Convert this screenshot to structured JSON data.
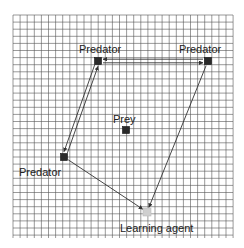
{
  "grid": {
    "x0": 13,
    "y0": 15,
    "x1": 233,
    "y1": 238,
    "spacing": 7.1,
    "line_color": "#555555"
  },
  "colors": {
    "agent_fill": "#2a2a2a",
    "learning_agent_fill": "#cfcfcf",
    "edge": "#333333",
    "text": "#222222"
  },
  "nodes": [
    {
      "id": "predator-top-left",
      "label": "Predator",
      "x": 98,
      "y": 61,
      "label_x": 79,
      "label_y": 44
    },
    {
      "id": "predator-top-right",
      "label": "Predator",
      "x": 208,
      "y": 61,
      "label_x": 179,
      "label_y": 44
    },
    {
      "id": "predator-left",
      "label": "Predator",
      "x": 64,
      "y": 157,
      "label_x": 19,
      "label_y": 167
    },
    {
      "id": "prey",
      "label": "Prey",
      "x": 126,
      "y": 130,
      "label_x": 113,
      "label_y": 114
    },
    {
      "id": "learning-agent",
      "label": "Learning agent",
      "x": 147,
      "y": 212,
      "label_x": 120,
      "label_y": 223
    }
  ],
  "edges": [
    {
      "from": "predator-top-left",
      "to": "predator-top-right",
      "style": "double",
      "arrows": "both"
    },
    {
      "from": "predator-top-left",
      "to": "predator-left",
      "style": "double",
      "arrows": "both"
    },
    {
      "from": "predator-left",
      "to": "learning-agent",
      "style": "single",
      "arrows": "end"
    },
    {
      "from": "predator-top-right",
      "to": "learning-agent",
      "style": "single",
      "arrows": "end"
    }
  ]
}
